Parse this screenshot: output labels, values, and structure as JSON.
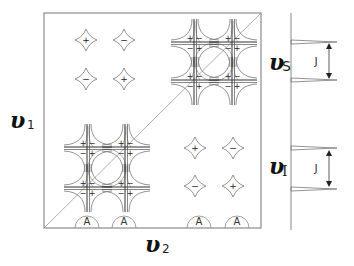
{
  "figure": {
    "axes": {
      "x_label": "υ",
      "x_sub": "2",
      "y_label": "υ",
      "y_sub": "1"
    },
    "spectrum": {
      "label_s": "υ",
      "label_s_sub": "S",
      "label_i": "υ",
      "label_i_sub": "I",
      "coupling_label_top": "J",
      "coupling_label_bottom": "J"
    },
    "antiphase_peaks_top_left": [
      {
        "sign": "+"
      },
      {
        "sign": "−"
      },
      {
        "sign": "−"
      },
      {
        "sign": "+"
      }
    ],
    "antiphase_peaks_bottom_right": [
      {
        "sign": "+"
      },
      {
        "sign": "−"
      },
      {
        "sign": "−"
      },
      {
        "sign": "+"
      }
    ],
    "baseline_labels": [
      "A",
      "A",
      "A",
      "A"
    ],
    "multiplet_quadrant_signs": [
      "+",
      "−",
      "−",
      "+"
    ]
  }
}
